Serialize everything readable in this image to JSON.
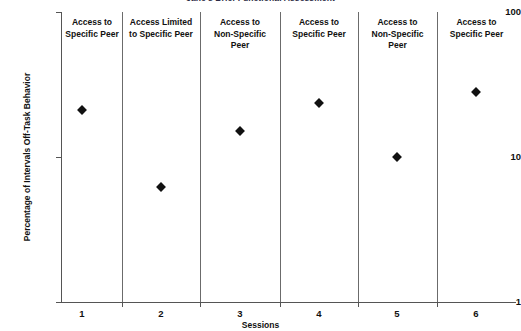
{
  "chart_data": {
    "type": "scatter",
    "title": "Jane's Brief Functional Assessment",
    "xlabel": "Sessions",
    "ylabel": "Percentage of Intervals Off-Task Behavior",
    "yscale": "log",
    "ylim": [
      1,
      100
    ],
    "ytick_labels": [
      "100",
      "10",
      "1"
    ],
    "ytick_values": [
      100,
      10,
      1
    ],
    "grid": false,
    "legend": "none",
    "x": [
      1,
      2,
      3,
      4,
      5,
      6
    ],
    "xtick_labels": [
      "1",
      "2",
      "3",
      "4",
      "5",
      "6"
    ],
    "categories": [
      "1",
      "2",
      "3",
      "4",
      "5",
      "6"
    ],
    "values": [
      21,
      6.2,
      15,
      23.5,
      10,
      28
    ],
    "series": [
      {
        "name": "Percentage of Intervals Off-Task Behavior",
        "marker": "filled-diamond",
        "color": "#111111",
        "values": [
          21,
          6.2,
          15,
          23.5,
          10,
          28
        ]
      }
    ],
    "phases": [
      {
        "label": "Access to\nSpecific Peer",
        "sessions": [
          1
        ]
      },
      {
        "label": "Access Limited\nto Specific Peer",
        "sessions": [
          2
        ]
      },
      {
        "label": "Access to\nNon-Specific\nPeer",
        "sessions": [
          3
        ]
      },
      {
        "label": "Access to\nSpecific Peer",
        "sessions": [
          4
        ]
      },
      {
        "label": "Access to\nNon-Specific\nPeer",
        "sessions": [
          5
        ]
      },
      {
        "label": "Access to\nSpecific Peer",
        "sessions": [
          6
        ]
      }
    ],
    "phase_labels": [
      "Access to Specific Peer",
      "Access Limited to Specific Peer",
      "Access to Non-Specific Peer",
      "Access to Specific Peer",
      "Access to Non-Specific Peer",
      "Access to Specific Peer"
    ],
    "annotations": []
  },
  "axes": {
    "y_title": "Percentage of Intervals Off-Task Behavior",
    "x_title": "Sessions",
    "y_labels": {
      "top": "100",
      "mid": "10",
      "bottom": "1"
    },
    "x_labels": {
      "s1": "1",
      "s2": "2",
      "s3": "3",
      "s4": "4",
      "s5": "5",
      "s6": "6"
    }
  },
  "phase_label_lines": {
    "p1": {
      "l1": "Access to",
      "l2": "Specific Peer",
      "l3": ""
    },
    "p2": {
      "l1": "Access Limited",
      "l2": "to Specific Peer",
      "l3": ""
    },
    "p3": {
      "l1": "Access to",
      "l2": "Non-Specific",
      "l3": "Peer"
    },
    "p4": {
      "l1": "Access to",
      "l2": "Specific Peer",
      "l3": ""
    },
    "p5": {
      "l1": "Access to",
      "l2": "Non-Specific",
      "l3": "Peer"
    },
    "p6": {
      "l1": "Access to",
      "l2": "Specific Peer",
      "l3": ""
    }
  },
  "title": "Jane's Brief Functional Assessment",
  "colors": {
    "marker": "#111111",
    "axis": "#555555",
    "phase_line": "#6b6b6b",
    "background": "#ffffff"
  }
}
